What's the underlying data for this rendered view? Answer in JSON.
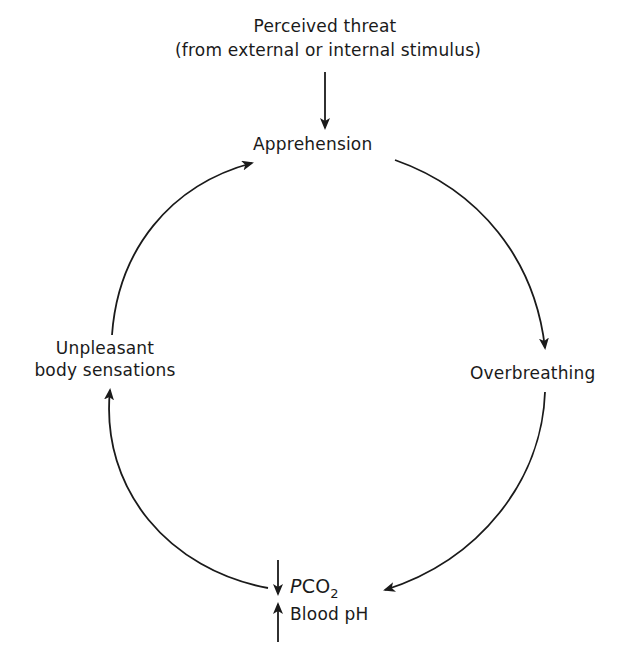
{
  "diagram": {
    "title_line1": "Perceived threat",
    "title_line2": "(from external or internal stimulus)",
    "nodes": {
      "apprehension": "Apprehension",
      "overbreathing": "Overbreathing",
      "pco2_italic": "P",
      "pco2_main": "CO",
      "pco2_sub": "2",
      "blood_ph": "Blood pH",
      "unpleasant_line1": "Unpleasant",
      "unpleasant_line2": "body sensations"
    },
    "indicators": {
      "pco2_direction": "down",
      "blood_ph_direction": "up"
    },
    "cycle_order": [
      "Apprehension",
      "Overbreathing",
      "PCO2 down / Blood pH up",
      "Unpleasant body sensations"
    ],
    "colors": {
      "ink": "#1a1a1a",
      "background": "#ffffff"
    }
  }
}
